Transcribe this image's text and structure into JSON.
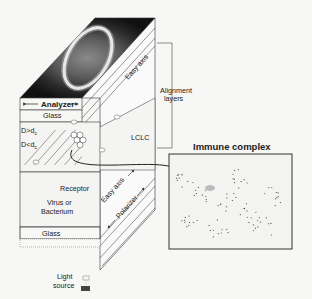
{
  "diagram": {
    "labels": {
      "analyzer": "Analyzer",
      "top_glass": "Glass",
      "easy_axis_top": "Easy axis",
      "alignment_layers_line1": "Alignment",
      "alignment_layers_line2": "layers",
      "d_greater": "D>d",
      "d_greater_sub": "c",
      "d_less": "D<d",
      "d_less_sub": "c",
      "lclc": "LCLC",
      "receptor": "Receptor",
      "virus_line1": "Virus or",
      "virus_line2": "Bacterium",
      "bottom_glass": "Glass",
      "easy_axis_bottom": "Easy axis",
      "polarizer": "Polarizer",
      "light_line1": "Light",
      "light_line2": "source",
      "immune_complex": "Immune complex"
    },
    "colors": {
      "background": "#f7f7f5",
      "line": "#333333",
      "image_dark": "#1a1a1a",
      "ring": "#ffffff"
    }
  }
}
